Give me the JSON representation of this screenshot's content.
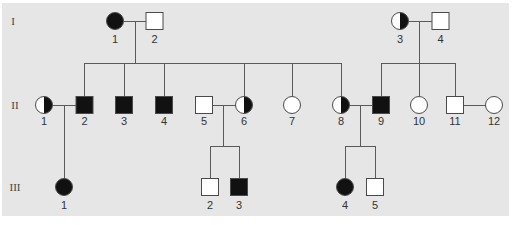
{
  "diagram": {
    "type": "pedigree",
    "generations": [
      {
        "label": "I"
      },
      {
        "label": "II"
      },
      {
        "label": "III"
      }
    ],
    "individuals": {
      "I": [
        {
          "id": "1",
          "sex": "female",
          "status": "affected"
        },
        {
          "id": "2",
          "sex": "male",
          "status": "unaffected"
        },
        {
          "id": "3",
          "sex": "female",
          "status": "carrier"
        },
        {
          "id": "4",
          "sex": "male",
          "status": "unaffected"
        }
      ],
      "II": [
        {
          "id": "1",
          "sex": "female",
          "status": "carrier"
        },
        {
          "id": "2",
          "sex": "male",
          "status": "affected"
        },
        {
          "id": "3",
          "sex": "male",
          "status": "affected"
        },
        {
          "id": "4",
          "sex": "male",
          "status": "affected"
        },
        {
          "id": "5",
          "sex": "male",
          "status": "unaffected"
        },
        {
          "id": "6",
          "sex": "female",
          "status": "carrier"
        },
        {
          "id": "7",
          "sex": "female",
          "status": "unaffected"
        },
        {
          "id": "8",
          "sex": "female",
          "status": "carrier"
        },
        {
          "id": "9",
          "sex": "male",
          "status": "affected"
        },
        {
          "id": "10",
          "sex": "female",
          "status": "unaffected"
        },
        {
          "id": "11",
          "sex": "male",
          "status": "unaffected"
        },
        {
          "id": "12",
          "sex": "female",
          "status": "unaffected"
        }
      ],
      "III": [
        {
          "id": "1",
          "sex": "female",
          "status": "affected"
        },
        {
          "id": "2",
          "sex": "male",
          "status": "unaffected"
        },
        {
          "id": "3",
          "sex": "male",
          "status": "affected"
        },
        {
          "id": "4",
          "sex": "female",
          "status": "affected"
        },
        {
          "id": "5",
          "sex": "male",
          "status": "unaffected"
        }
      ]
    },
    "matings": [
      {
        "partners": [
          "I-1",
          "I-2"
        ],
        "children": [
          "II-2",
          "II-3",
          "II-4",
          "II-6",
          "II-7",
          "II-8"
        ]
      },
      {
        "partners": [
          "I-3",
          "I-4"
        ],
        "children": [
          "II-9",
          "II-10",
          "II-11"
        ]
      },
      {
        "partners": [
          "II-1",
          "II-2"
        ],
        "children": [
          "III-1"
        ]
      },
      {
        "partners": [
          "II-5",
          "II-6"
        ],
        "children": [
          "III-2",
          "III-3"
        ]
      },
      {
        "partners": [
          "II-8",
          "II-9"
        ],
        "children": [
          "III-4",
          "III-5"
        ]
      },
      {
        "partners": [
          "II-11",
          "II-12"
        ],
        "children": []
      }
    ],
    "colors": {
      "background": "#e6e6e6",
      "affected": "#111111",
      "unaffected": "#ffffff",
      "line": "#5a5a5a"
    }
  }
}
